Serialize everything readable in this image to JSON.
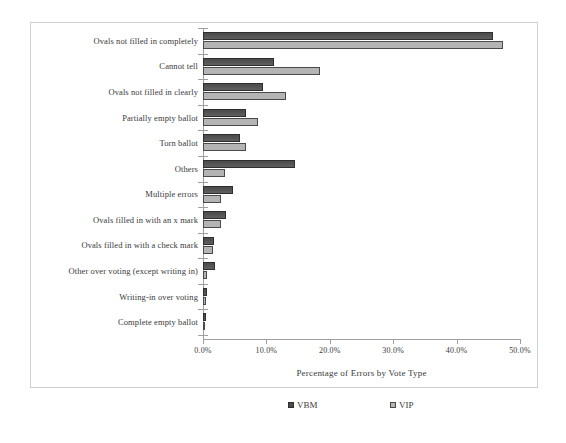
{
  "top_bleed_text": "",
  "chart_data": {
    "type": "bar",
    "orientation": "horizontal",
    "title": "",
    "xlabel": "Percentage of Errors by Vote Type",
    "ylabel": "",
    "xlim": [
      0,
      50
    ],
    "grid": false,
    "legend_position": "bottom",
    "tick_labels": [
      "0.0%",
      "10.0%",
      "20.0%",
      "30.0%",
      "40.0%",
      "50.0%"
    ],
    "tick_values": [
      0,
      10,
      20,
      30,
      40,
      50
    ],
    "categories": [
      "Ovals not filled in completely",
      "Cannot tell",
      "Ovals not filled in clearly",
      "Partially empty ballot",
      "Torn ballot",
      "Others",
      "Multiple errors",
      "Ovals filled in with an x mark",
      "Ovals filled in with a check mark",
      "Other over voting (except writing in)",
      "Writing-in over voting",
      "Complete empty ballot"
    ],
    "series": [
      {
        "name": "VBM",
        "color": "#555555",
        "values": [
          45.8,
          11.2,
          9.5,
          6.8,
          5.9,
          14.5,
          4.8,
          3.6,
          1.7,
          1.9,
          0.7,
          0.4
        ]
      },
      {
        "name": "VIP",
        "color": "#b4b4b4",
        "values": [
          47.3,
          18.5,
          13.1,
          8.7,
          6.8,
          3.5,
          2.8,
          2.8,
          1.5,
          0.7,
          0.4,
          0.3
        ]
      }
    ]
  },
  "legend": {
    "items": [
      {
        "label": "VBM",
        "style": "vbm"
      },
      {
        "label": "VIP",
        "style": "vip"
      }
    ]
  }
}
